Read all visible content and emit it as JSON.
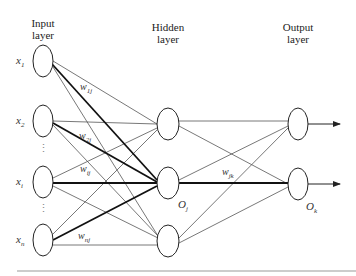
{
  "layers": {
    "input": {
      "title_line1": "Input",
      "title_line2": "layer"
    },
    "hidden": {
      "title_line1": "Hidden",
      "title_line2": "layer"
    },
    "output": {
      "title_line1": "Output",
      "title_line2": "layer"
    }
  },
  "input_nodes": [
    {
      "label": "x",
      "sub": "1"
    },
    {
      "label": "x",
      "sub": "2"
    },
    {
      "label": "x",
      "sub": "i"
    },
    {
      "label": "x",
      "sub": "n"
    }
  ],
  "hidden_label": {
    "label": "O",
    "sub": "j"
  },
  "output_label": {
    "label": "O",
    "sub": "k"
  },
  "weights": {
    "w1j": {
      "label": "w",
      "sub": "1j"
    },
    "w2j": {
      "label": "w",
      "sub": "2j"
    },
    "wij": {
      "label": "w",
      "sub": "ij"
    },
    "wnj": {
      "label": "w",
      "sub": "nj"
    },
    "wjk": {
      "label": "w",
      "sub": "jk"
    }
  },
  "ellipsis": "⋮",
  "colors": {
    "stroke": "#333333",
    "rule": "#999999"
  }
}
